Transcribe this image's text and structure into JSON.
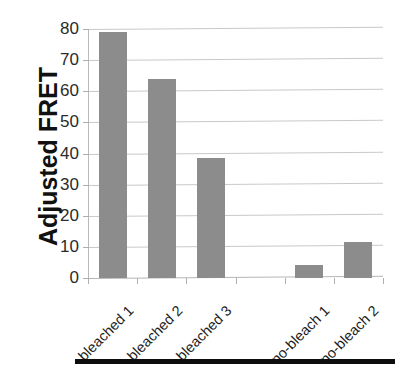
{
  "chart_data": {
    "type": "bar",
    "title": "",
    "subtitle": "",
    "xlabel": "",
    "ylabel": "Adjusted FRET",
    "categories": [
      "bleached 1",
      "bleached 2",
      "bleached 3",
      "",
      "no-bleach 1",
      "no-bleach 2"
    ],
    "values": [
      79,
      64,
      38.5,
      null,
      4.2,
      11.7
    ],
    "ylim": [
      0,
      80
    ],
    "y_ticks": [
      0,
      10,
      20,
      30,
      40,
      50,
      60,
      70,
      80
    ],
    "y_tick_labels": [
      "0",
      "10",
      "20",
      "30",
      "40",
      "50",
      "60",
      "70",
      "80"
    ],
    "grid": true,
    "grid_axis": "y",
    "legend": false,
    "bar_color": "#8c8c8c",
    "gridline_color": "#c9c9c9",
    "axis_text_color": "#2b2b2b",
    "series": [
      {
        "name": "Adjusted FRET",
        "values": [
          79,
          64,
          38.5,
          null,
          4.2,
          11.7
        ]
      }
    ]
  },
  "axis": {
    "y_title": "Adjusted FRET",
    "ticks": [
      {
        "label": "80",
        "value": 80
      },
      {
        "label": "70",
        "value": 70
      },
      {
        "label": "60",
        "value": 60
      },
      {
        "label": "50",
        "value": 50
      },
      {
        "label": "40",
        "value": 40
      },
      {
        "label": "30",
        "value": 30
      },
      {
        "label": "20",
        "value": 20
      },
      {
        "label": "10",
        "value": 10
      },
      {
        "label": "0",
        "value": 0
      }
    ],
    "categories": [
      {
        "label": "bleached 1"
      },
      {
        "label": "bleached 2"
      },
      {
        "label": "bleached 3"
      },
      {
        "label": ""
      },
      {
        "label": "no-bleach 1"
      },
      {
        "label": "no-bleach 2"
      }
    ]
  }
}
